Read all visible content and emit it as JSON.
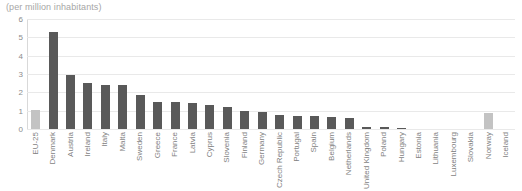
{
  "chart_data": {
    "type": "bar",
    "title": "(per million inhabitants)",
    "xlabel": "",
    "ylabel": "",
    "ylim": [
      0,
      6
    ],
    "yticks": [
      0,
      1,
      2,
      3,
      4,
      5,
      6
    ],
    "grid": true,
    "legend": "none",
    "categories": [
      "EU-25",
      "Denmark",
      "Austria",
      "Ireland",
      "Italy",
      "Malta",
      "Sweden",
      "Greece",
      "France",
      "Latvia",
      "Cyprus",
      "Slovenia",
      "Finland",
      "Germany",
      "Czech Republic",
      "Portugal",
      "Spain",
      "Belgium",
      "Netherlands",
      "United Kingdom",
      "Poland",
      "Hungary",
      "Estonia",
      "Lithuania",
      "Luxembourg",
      "Slovakia",
      "Norway",
      "Iceland"
    ],
    "values": [
      1.05,
      5.3,
      2.95,
      2.5,
      2.4,
      2.4,
      1.85,
      1.5,
      1.45,
      1.4,
      1.3,
      1.2,
      1.0,
      0.95,
      0.75,
      0.7,
      0.7,
      0.65,
      0.6,
      0.12,
      0.1,
      0.08,
      0.0,
      0.0,
      0.0,
      0.0,
      0.85,
      0.0
    ],
    "bar_styles": [
      "light",
      "dark",
      "dark",
      "dark",
      "dark",
      "dark",
      "dark",
      "dark",
      "dark",
      "dark",
      "dark",
      "dark",
      "dark",
      "dark",
      "dark",
      "dark",
      "dark",
      "dark",
      "dark",
      "dark",
      "dark",
      "dark",
      "dark",
      "dark",
      "dark",
      "dark",
      "light",
      "dark"
    ],
    "colors": {
      "bar_dark": "#595959",
      "bar_light": "#c3c3c3",
      "gridline": "#e9e9e9",
      "tick_text": "#8c8c8c",
      "label_text": "#7f7f7f",
      "title_text": "#a6a6a6",
      "background": "#ffffff"
    }
  }
}
